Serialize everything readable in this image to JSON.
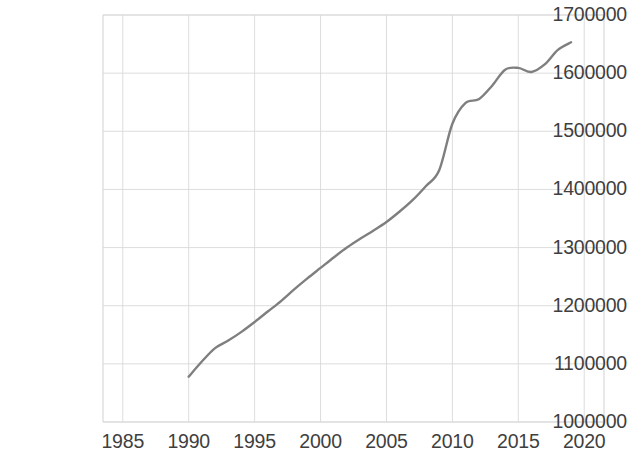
{
  "chart_data": {
    "type": "line",
    "title": "",
    "subtitle": "",
    "xlabel": "",
    "ylabel": "",
    "xlim": [
      1983.5,
      2021.5
    ],
    "ylim": [
      1000000,
      1700000
    ],
    "grid": true,
    "legend": "none",
    "line_color": "#7f7f7f",
    "axis_color": "#d9d9d9",
    "text_color": "#3f3f3f",
    "xticks": [
      1985,
      1990,
      1995,
      2000,
      2005,
      2010,
      2015,
      2020
    ],
    "xtick_labels": [
      "1985",
      "1990",
      "1995",
      "2000",
      "2005",
      "2010",
      "2015",
      "2020"
    ],
    "yticks": [
      1000000,
      1100000,
      1200000,
      1300000,
      1400000,
      1500000,
      1600000,
      1700000
    ],
    "ytick_labels": [
      "1000000",
      "1100000",
      "1200000",
      "1300000",
      "1400000",
      "1500000",
      "1600000",
      "1700000"
    ],
    "series": [
      {
        "name": "Population",
        "x": [
          1990,
          1991,
          1992,
          1993,
          1994,
          1995,
          1996,
          1997,
          1998,
          1999,
          2000,
          2001,
          2002,
          2003,
          2004,
          2005,
          2006,
          2007,
          2008,
          2009,
          2010,
          2011,
          2012,
          2013,
          2014,
          2015,
          2016,
          2017,
          2018,
          2019
        ],
        "values": [
          1078000,
          1104000,
          1127000,
          1140000,
          1155000,
          1172000,
          1190000,
          1208000,
          1228000,
          1247000,
          1265000,
          1283000,
          1300000,
          1315000,
          1329000,
          1344000,
          1362000,
          1382000,
          1406000,
          1433000,
          1513000,
          1549000,
          1555000,
          1578000,
          1606000,
          1609000,
          1602000,
          1615000,
          1640000,
          1653000
        ]
      }
    ]
  }
}
